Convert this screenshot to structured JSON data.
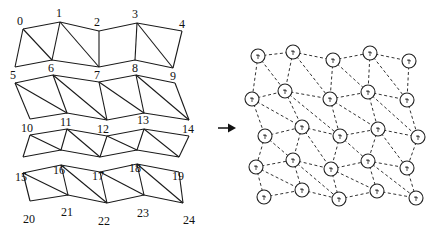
{
  "left_mesh": {
    "title": "Triangulated quad mesh (strips)",
    "vertices": [
      {
        "id": "0",
        "label": "0",
        "x": 23,
        "y": 29,
        "lx": 17,
        "ly": 25
      },
      {
        "id": "1",
        "label": "1",
        "x": 60,
        "y": 22,
        "lx": 56,
        "ly": 17
      },
      {
        "id": "2",
        "label": "2",
        "x": 99,
        "y": 31,
        "lx": 94,
        "ly": 26
      },
      {
        "id": "3",
        "label": "3",
        "x": 137,
        "y": 23,
        "lx": 132,
        "ly": 18
      },
      {
        "id": "4",
        "label": "4",
        "x": 182,
        "y": 31,
        "lx": 179,
        "ly": 28
      },
      {
        "id": "5",
        "label": "5",
        "x": 15,
        "y": 83,
        "lx": 10,
        "ly": 79
      },
      {
        "id": "6",
        "label": "6",
        "x": 53,
        "y": 75,
        "lx": 48,
        "ly": 72
      },
      {
        "id": "7",
        "label": "7",
        "x": 99,
        "y": 82,
        "lx": 94,
        "ly": 79
      },
      {
        "id": "8",
        "label": "8",
        "x": 136,
        "y": 75,
        "lx": 132,
        "ly": 72
      },
      {
        "id": "9",
        "label": "9",
        "x": 175,
        "y": 83,
        "lx": 170,
        "ly": 80
      },
      {
        "id": "10",
        "label": "10",
        "x": 30,
        "y": 135,
        "lx": 21,
        "ly": 132
      },
      {
        "id": "11",
        "label": "11",
        "x": 67,
        "y": 129,
        "lx": 60,
        "ly": 126
      },
      {
        "id": "12",
        "label": "12",
        "x": 107,
        "y": 136,
        "lx": 97,
        "ly": 133
      },
      {
        "id": "13",
        "label": "13",
        "x": 144,
        "y": 129,
        "lx": 137,
        "ly": 124
      },
      {
        "id": "14",
        "label": "14",
        "x": 189,
        "y": 136,
        "lx": 182,
        "ly": 133
      },
      {
        "id": "15",
        "label": "15",
        "x": 23,
        "y": 173,
        "lx": 15,
        "ly": 181
      },
      {
        "id": "16",
        "label": "16",
        "x": 61,
        "y": 165,
        "lx": 53,
        "ly": 174
      },
      {
        "id": "17",
        "label": "17",
        "x": 100,
        "y": 172,
        "lx": 92,
        "ly": 180
      },
      {
        "id": "18",
        "label": "18",
        "x": 137,
        "y": 164,
        "lx": 129,
        "ly": 172
      },
      {
        "id": "19",
        "label": "19",
        "x": 179,
        "y": 172,
        "lx": 172,
        "ly": 180
      },
      {
        "id": "20",
        "label": "20",
        "x": 30,
        "y": 209,
        "lx": 23,
        "ly": 223
      },
      {
        "id": "21",
        "label": "21",
        "x": 68,
        "y": 203,
        "lx": 61,
        "ly": 216
      },
      {
        "id": "22",
        "label": "22",
        "x": 107,
        "y": 211,
        "lx": 98,
        "ly": 225
      },
      {
        "id": "23",
        "label": "23",
        "x": 144,
        "y": 203,
        "lx": 137,
        "ly": 217
      },
      {
        "id": "24",
        "label": "24",
        "x": 183,
        "y": 210,
        "lx": 183,
        "ly": 224
      }
    ],
    "strips": [
      {
        "top": [
          [
            23,
            29
          ],
          [
            60,
            22
          ],
          [
            99,
            31
          ],
          [
            137,
            23
          ],
          [
            182,
            31
          ]
        ],
        "bottom": [
          [
            15,
            67
          ],
          [
            52,
            60
          ],
          [
            99,
            67
          ],
          [
            135,
            60
          ],
          [
            173,
            68
          ]
        ],
        "diagonals": [
          [
            0,
            1
          ],
          [
            1,
            2
          ],
          [
            3,
            4
          ]
        ],
        "vertical_only": [
          2
        ]
      },
      {
        "top": [
          [
            15,
            83
          ],
          [
            53,
            75
          ],
          [
            99,
            82
          ],
          [
            136,
            75
          ],
          [
            175,
            83
          ]
        ],
        "bottom": [
          [
            30,
            119
          ],
          [
            67,
            113
          ],
          [
            107,
            120
          ],
          [
            144,
            113
          ],
          [
            189,
            120
          ]
        ],
        "diagonals": [
          [
            0,
            1
          ],
          [
            1,
            2
          ],
          [
            2,
            3
          ],
          [
            3,
            4
          ]
        ]
      },
      {
        "top": [
          [
            30,
            135
          ],
          [
            67,
            129
          ],
          [
            107,
            136
          ],
          [
            144,
            129
          ],
          [
            189,
            136
          ]
        ],
        "bottom": [
          [
            23,
            157
          ],
          [
            61,
            150
          ],
          [
            100,
            157
          ],
          [
            137,
            150
          ],
          [
            179,
            157
          ]
        ],
        "diagonals": [
          [
            0,
            1
          ],
          [
            1,
            2
          ],
          [
            2,
            3
          ],
          [
            3,
            4
          ]
        ]
      },
      {
        "top": [
          [
            23,
            173
          ],
          [
            61,
            165
          ],
          [
            100,
            172
          ],
          [
            137,
            164
          ],
          [
            179,
            172
          ]
        ],
        "bottom": [
          [
            30,
            201
          ],
          [
            68,
            195
          ],
          [
            107,
            203
          ],
          [
            144,
            195
          ],
          [
            183,
            203
          ]
        ],
        "diagonals": [
          [
            0,
            1
          ],
          [
            1,
            2
          ],
          [
            2,
            3
          ],
          [
            3,
            4
          ]
        ]
      }
    ]
  },
  "arrow": {
    "direction": "right",
    "x1": 218,
    "y1": 128,
    "x2": 236,
    "y2": 128
  },
  "right_graph": {
    "title": "Dual graph (nodes with dashed adjacency edges)",
    "node_radius": 7,
    "nodes": [
      [
        [
          258,
          56
        ],
        [
          293,
          52
        ],
        [
          333,
          60
        ],
        [
          370,
          53
        ],
        [
          409,
          61
        ]
      ],
      [
        [
          252,
          99
        ],
        [
          285,
          91
        ],
        [
          330,
          99
        ],
        [
          368,
          92
        ],
        [
          407,
          100
        ]
      ],
      [
        [
          265,
          136
        ],
        [
          302,
          127
        ],
        [
          340,
          136
        ],
        [
          378,
          129
        ],
        [
          418,
          137
        ]
      ],
      [
        [
          256,
          167
        ],
        [
          293,
          160
        ],
        [
          331,
          169
        ],
        [
          368,
          161
        ],
        [
          407,
          168
        ]
      ],
      [
        [
          264,
          197
        ],
        [
          302,
          190
        ],
        [
          339,
          199
        ],
        [
          377,
          191
        ],
        [
          416,
          198
        ]
      ]
    ]
  }
}
